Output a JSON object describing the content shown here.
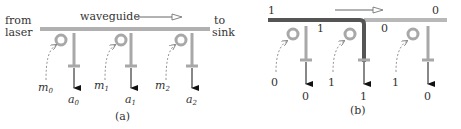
{
  "panel_a": {
    "left_label_line1": "from",
    "left_label_line2": "laser",
    "waveguide_label": "waveguide",
    "right_label_line1": "to",
    "right_label_line2": "sink",
    "modulators": [
      {
        "m": "m",
        "m_sub": "0",
        "a": "a",
        "a_sub": "0"
      },
      {
        "m": "m",
        "m_sub": "1",
        "a": "a",
        "a_sub": "1"
      },
      {
        "m": "m",
        "m_sub": "2",
        "a": "a",
        "a_sub": "2"
      }
    ],
    "caption": "(a)"
  },
  "panel_b": {
    "input_value": "1",
    "output_value": "0",
    "segment_after_ring0": "1",
    "segment_after_ring1": "0",
    "modulator_inputs": [
      "0",
      "1",
      "1"
    ],
    "detector_outputs": [
      "0",
      "1",
      "0"
    ],
    "caption": "(b)"
  },
  "colors": {
    "waveguide_light": "#b0b0b0",
    "waveguide_dark": "#555555",
    "ring": "#a8a8a8",
    "arrow": "#111111",
    "text": "#333333"
  }
}
